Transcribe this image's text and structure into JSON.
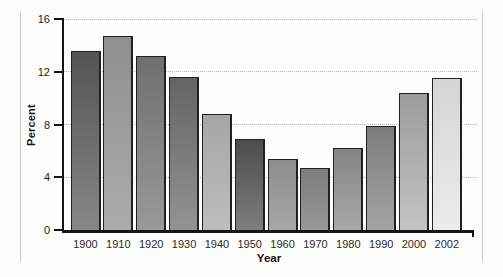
{
  "chart_data": {
    "type": "bar",
    "title": "",
    "xlabel": "Year",
    "ylabel": "Percent",
    "categories": [
      "1900",
      "1910",
      "1920",
      "1930",
      "1940",
      "1950",
      "1960",
      "1970",
      "1980",
      "1990",
      "2000",
      "2002"
    ],
    "values": [
      13.6,
      14.7,
      13.2,
      11.6,
      8.8,
      6.9,
      5.4,
      4.7,
      6.2,
      7.9,
      10.4,
      11.5
    ],
    "ylim": [
      0,
      16
    ],
    "yticks": [
      0,
      4,
      8,
      12,
      16
    ],
    "grid": "horizontal-dotted",
    "legend": "none",
    "bar_gradients": [
      {
        "top": "#545454",
        "bottom": "#878787"
      },
      {
        "top": "#8f8f8f",
        "bottom": "#acacac"
      },
      {
        "top": "#6f6f6f",
        "bottom": "#999999"
      },
      {
        "top": "#646464",
        "bottom": "#939393"
      },
      {
        "top": "#a6a6a6",
        "bottom": "#bdbdbd"
      },
      {
        "top": "#4c4c4c",
        "bottom": "#7e7e7e"
      },
      {
        "top": "#8d8d8d",
        "bottom": "#a7a7a7"
      },
      {
        "top": "#7c7c7c",
        "bottom": "#989898"
      },
      {
        "top": "#858585",
        "bottom": "#a8a8a8"
      },
      {
        "top": "#7d7d7d",
        "bottom": "#a4a4a4"
      },
      {
        "top": "#9c9c9c",
        "bottom": "#c3c3c3"
      },
      {
        "top": "#d5d5d5",
        "bottom": "#ececec"
      }
    ],
    "colors": {
      "bar_border": "#202020",
      "axis": "#141414",
      "gridline": "#b7b7b7",
      "panel_frame": "#cccccc",
      "background": "#fdfdfc",
      "tick_label": "#1c1c1c"
    }
  }
}
